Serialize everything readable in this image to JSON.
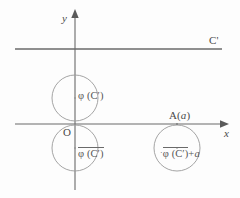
{
  "figure": {
    "background_color": "#fdfdfd",
    "stroke_color": "#6a6a6a",
    "text_color": "#4a4a4a"
  },
  "axes": {
    "y_label": "y",
    "x_label": "x",
    "origin_label": "O",
    "x_axis": {
      "y": 124,
      "x_start": 15,
      "x_end": 223,
      "arrow": "right"
    },
    "y_axis": {
      "x": 75,
      "y_start": 14,
      "y_end": 190,
      "arrow": "up"
    }
  },
  "line_cprime": {
    "label": "C'",
    "y": 49,
    "x_start": 15,
    "x_end": 222
  },
  "points": [
    {
      "name": "point-a",
      "label": "A( a )",
      "label_text": "A(",
      "italic_part": "a",
      "label_tail": ")",
      "x": 177,
      "y": 124
    }
  ],
  "circles": [
    {
      "name": "upper-circle",
      "label_prefix": "φ (C′)",
      "overline": false,
      "marker": false,
      "cx": 75,
      "cy": 98,
      "r": 23
    },
    {
      "name": "lower-circle",
      "label_prefix": "φ (C′)",
      "overline": true,
      "marker": true,
      "cx": 75,
      "cy": 148,
      "r": 23
    },
    {
      "name": "right-circle",
      "label_prefix": "φ (C′)",
      "label_suffix": "+ a",
      "overline": true,
      "marker": true,
      "star": "·",
      "cx": 177,
      "cy": 148,
      "r": 23
    }
  ],
  "labels": {
    "phi_upper": "φ (C′)",
    "phi_lower": "φ (C′)",
    "phi_right_base": "φ (C′)",
    "phi_right_plus": "+",
    "phi_right_a": "a"
  }
}
